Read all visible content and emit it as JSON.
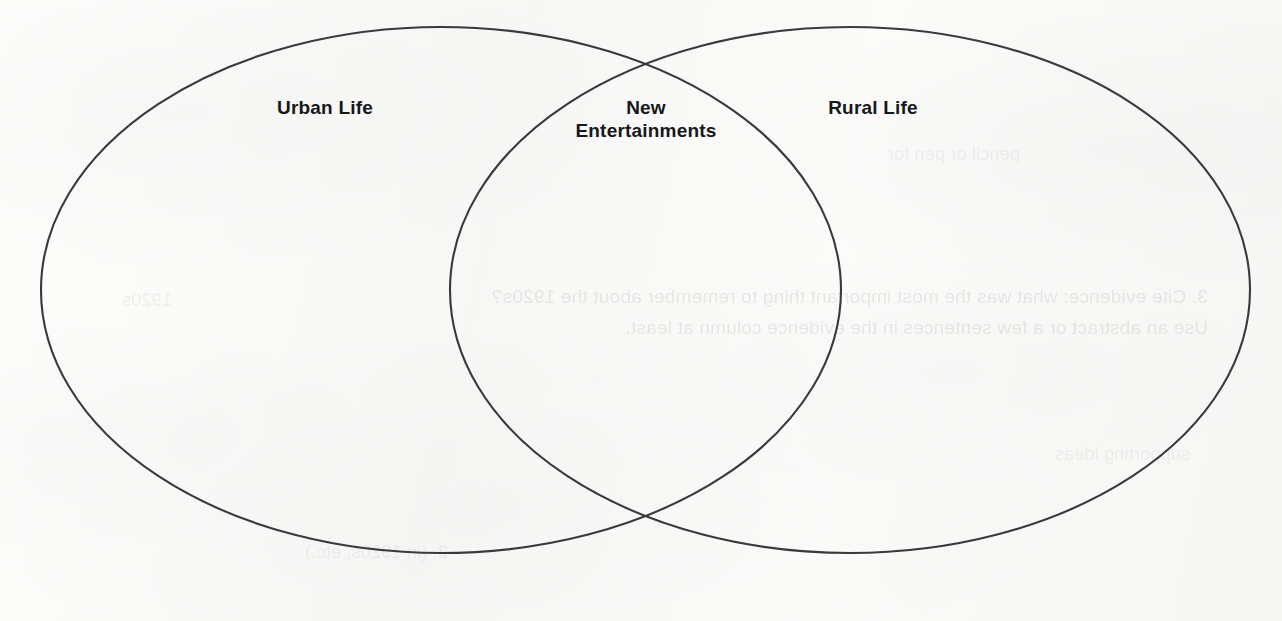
{
  "page": {
    "type": "venn-diagram-worksheet",
    "background_color": "#fbfbfa",
    "stroke_color": "#3a3a3a",
    "text_color": "#16181a",
    "width": 1282,
    "height": 621
  },
  "diagram": {
    "kind": "venn",
    "set_count": 2,
    "left_set": {
      "label": "Urban Life",
      "cx": 441,
      "cy": 290,
      "rx": 400,
      "ry": 263
    },
    "right_set": {
      "label": "Rural Life",
      "cx": 850,
      "cy": 290,
      "rx": 400,
      "ry": 263
    },
    "intersection": {
      "label": "New\nEntertainments"
    }
  },
  "bleed_through": {
    "line_a": "3. Cite evidence: what was the most important thing to remember about the 1920s?\nUse an abstract or a few sentences in the evidence column at least.",
    "line_b": "pencil or pen for",
    "line_c": "supporting ideas",
    "line_d": "2. (in 1920s, etc.)",
    "line_e": "1920s"
  }
}
